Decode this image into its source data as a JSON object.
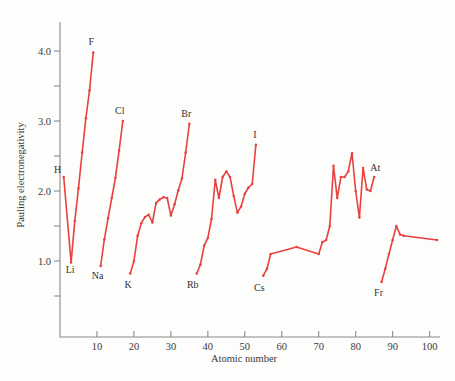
{
  "chart_data": {
    "type": "line",
    "title": "",
    "xlabel": "Atomic number",
    "ylabel": "Pauling electronegativity",
    "xlim": [
      0,
      102
    ],
    "ylim": [
      0.35,
      4.35
    ],
    "grid": false,
    "legend": "none",
    "line_color": "#e8413f",
    "marker_color": "#e8413f",
    "axis_color": "#8a8a8a",
    "x_ticks_major": [
      10,
      20,
      30,
      40,
      50,
      60,
      70,
      80,
      90,
      100
    ],
    "x_tick_labels": [
      "10",
      "20",
      "30",
      "40",
      "50",
      "60",
      "70",
      "80",
      "90",
      "100"
    ],
    "y_ticks_major": [
      1.0,
      2.0,
      3.0,
      4.0
    ],
    "y_tick_labels": [
      "1.0",
      "2.0",
      "3.0",
      "4.0"
    ],
    "y_ticks_minor": [
      0.5,
      1.5,
      2.5,
      3.5
    ],
    "series": [
      {
        "name": "Period 1-2 (H to F)",
        "x": [
          1,
          3,
          4,
          5,
          6,
          7,
          8,
          9
        ],
        "values": [
          2.2,
          0.98,
          1.57,
          2.04,
          2.55,
          3.04,
          3.44,
          3.98
        ]
      },
      {
        "name": "Period 3 (Na to Cl)",
        "x": [
          11,
          12,
          13,
          14,
          15,
          16,
          17
        ],
        "values": [
          0.93,
          1.31,
          1.61,
          1.9,
          2.19,
          2.58,
          3.0
        ]
      },
      {
        "name": "Period 4 (K to Br)",
        "x": [
          19,
          20,
          21,
          22,
          23,
          24,
          25,
          26,
          27,
          28,
          29,
          30,
          31,
          32,
          33,
          34,
          35
        ],
        "values": [
          0.82,
          1.0,
          1.36,
          1.54,
          1.63,
          1.66,
          1.55,
          1.83,
          1.88,
          1.91,
          1.9,
          1.65,
          1.81,
          2.01,
          2.18,
          2.55,
          2.96
        ]
      },
      {
        "name": "Period 5 (Rb to I)",
        "x": [
          37,
          38,
          39,
          40,
          41,
          42,
          43,
          44,
          45,
          46,
          47,
          48,
          49,
          50,
          51,
          52,
          53
        ],
        "values": [
          0.82,
          0.95,
          1.22,
          1.33,
          1.6,
          2.16,
          1.9,
          2.2,
          2.28,
          2.2,
          1.93,
          1.69,
          1.78,
          1.96,
          2.05,
          2.1,
          2.66
        ]
      },
      {
        "name": "Period 6 (Cs to At)",
        "x": [
          55,
          56,
          57,
          64,
          70,
          71,
          72,
          73,
          74,
          75,
          76,
          77,
          78,
          79,
          80,
          81,
          82,
          83,
          84,
          85
        ],
        "values": [
          0.79,
          0.89,
          1.1,
          1.2,
          1.1,
          1.27,
          1.3,
          1.5,
          2.36,
          1.9,
          2.2,
          2.2,
          2.28,
          2.54,
          2.0,
          1.62,
          2.33,
          2.02,
          2.0,
          2.2
        ]
      },
      {
        "name": "Period 7 (Fr to Lr)",
        "x": [
          87,
          88,
          89,
          90,
          91,
          92,
          93,
          102
        ],
        "values": [
          0.7,
          0.89,
          1.1,
          1.3,
          1.5,
          1.38,
          1.36,
          1.3
        ]
      }
    ],
    "annotations": [
      {
        "label": "H",
        "x": 1,
        "y": 2.2,
        "dx": -6,
        "dy": -4
      },
      {
        "label": "Li",
        "x": 3,
        "y": 0.98,
        "dx": -1,
        "dy": 11
      },
      {
        "label": "F",
        "x": 9,
        "y": 3.98,
        "dx": -2,
        "dy": -7
      },
      {
        "label": "Na",
        "x": 11,
        "y": 0.93,
        "dx": -3,
        "dy": 13
      },
      {
        "label": "Cl",
        "x": 17,
        "y": 3.0,
        "dx": -3,
        "dy": -7
      },
      {
        "label": "K",
        "x": 19,
        "y": 0.82,
        "dx": -2,
        "dy": 14
      },
      {
        "label": "Br",
        "x": 35,
        "y": 2.96,
        "dx": -3,
        "dy": -7
      },
      {
        "label": "Rb",
        "x": 37,
        "y": 0.82,
        "dx": -4,
        "dy": 14
      },
      {
        "label": "I",
        "x": 53,
        "y": 2.66,
        "dx": -1,
        "dy": -7
      },
      {
        "label": "Cs",
        "x": 55,
        "y": 0.79,
        "dx": -4,
        "dy": 15
      },
      {
        "label": "At",
        "x": 85,
        "y": 2.2,
        "dx": 1,
        "dy": -6
      },
      {
        "label": "Fr",
        "x": 87,
        "y": 0.7,
        "dx": -3,
        "dy": 14
      }
    ]
  }
}
